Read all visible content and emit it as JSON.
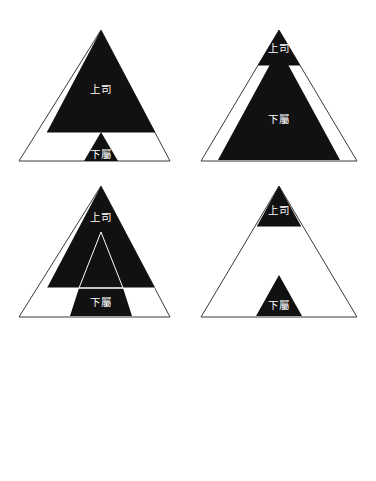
{
  "page": {
    "background_color": "#ffffff",
    "width": 376,
    "height": 481,
    "ink_color": "#111111",
    "outline_color": "#3a3a3a"
  },
  "labels": {
    "superior": "上司",
    "subordinate": "下屬"
  },
  "figures": [
    {
      "id": "figure-1",
      "name": "pyramid-top-heavy",
      "superior_label": "上司",
      "subordinate_label": "下屬",
      "superior_region": "large-black-upper-triangle",
      "subordinate_region": "small-black-center-triangle-on-base"
    },
    {
      "id": "figure-2",
      "name": "pyramid-small-cap-large-core",
      "superior_label": "上司",
      "subordinate_label": "下屬",
      "superior_region": "small-black-apex-cap",
      "subordinate_region": "large-black-inner-triangle"
    },
    {
      "id": "figure-3",
      "name": "pyramid-black-upper-with-outline-core",
      "superior_label": "上司",
      "subordinate_label": "下屬",
      "superior_region": "large-black-upper-triangle-with-white-outlined-inner-triangle",
      "subordinate_region": "black-trapezoid-column-on-base"
    },
    {
      "id": "figure-4",
      "name": "pyramid-two-small-black-caps",
      "superior_label": "上司",
      "subordinate_label": "下屬",
      "superior_region": "small-black-apex-cap",
      "subordinate_region": "small-black-triangle-on-base"
    }
  ]
}
